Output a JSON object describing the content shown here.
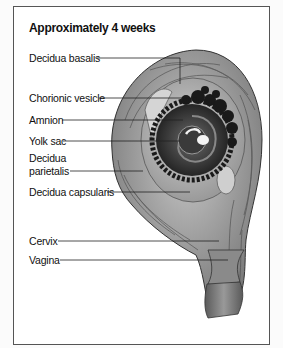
{
  "figure": {
    "title": "Approximately 4 weeks",
    "labels": [
      {
        "id": "decidua-basalis",
        "text": "Decidua basalis"
      },
      {
        "id": "chorionic-vesicle",
        "text": "Chorionic vesicle"
      },
      {
        "id": "amnion",
        "text": "Amnion"
      },
      {
        "id": "yolk-sac",
        "text": "Yolk sac"
      },
      {
        "id": "decidua-parietalis-1",
        "text": "Decidua"
      },
      {
        "id": "decidua-parietalis-2",
        "text": "parietalis"
      },
      {
        "id": "decidua-capsularis",
        "text": "Decidua capsularis"
      },
      {
        "id": "cervix",
        "text": "Cervix"
      },
      {
        "id": "vagina",
        "text": "Vagina"
      }
    ]
  }
}
